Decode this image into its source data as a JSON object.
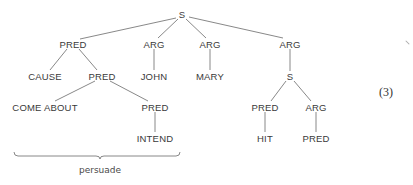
{
  "diagram": {
    "type": "syntax-tree",
    "equation_number": "(3)",
    "brace_label": "persuade",
    "nodes": [
      {
        "id": "s_root",
        "label": "S",
        "x": 182,
        "y": 14
      },
      {
        "id": "pred_1",
        "label": "PRED",
        "x": 73,
        "y": 44
      },
      {
        "id": "arg_john",
        "label": "ARG",
        "x": 154,
        "y": 44
      },
      {
        "id": "arg_mary",
        "label": "ARG",
        "x": 210,
        "y": 44
      },
      {
        "id": "arg_right",
        "label": "ARG",
        "x": 290,
        "y": 44
      },
      {
        "id": "cause",
        "label": "CAUSE",
        "x": 45,
        "y": 76
      },
      {
        "id": "pred_2",
        "label": "PRED",
        "x": 102,
        "y": 76
      },
      {
        "id": "john",
        "label": "JOHN",
        "x": 154,
        "y": 76
      },
      {
        "id": "mary",
        "label": "MARY",
        "x": 210,
        "y": 76
      },
      {
        "id": "s_inner",
        "label": "S",
        "x": 290,
        "y": 76
      },
      {
        "id": "come_about",
        "label": "COME ABOUT",
        "x": 45,
        "y": 107
      },
      {
        "id": "pred_3",
        "label": "PRED",
        "x": 155,
        "y": 107
      },
      {
        "id": "pred_hit",
        "label": "PRED",
        "x": 265,
        "y": 107
      },
      {
        "id": "arg_inner",
        "label": "ARG",
        "x": 316,
        "y": 107
      },
      {
        "id": "intend",
        "label": "INTEND",
        "x": 155,
        "y": 138
      },
      {
        "id": "hit",
        "label": "HIT",
        "x": 265,
        "y": 138
      },
      {
        "id": "pred_leaf",
        "label": "PRED",
        "x": 316,
        "y": 138
      }
    ],
    "edges": [
      [
        "s_root",
        "pred_1"
      ],
      [
        "s_root",
        "arg_john"
      ],
      [
        "s_root",
        "arg_mary"
      ],
      [
        "s_root",
        "arg_right"
      ],
      [
        "pred_1",
        "cause"
      ],
      [
        "pred_1",
        "pred_2"
      ],
      [
        "arg_john",
        "john"
      ],
      [
        "arg_mary",
        "mary"
      ],
      [
        "arg_right",
        "s_inner"
      ],
      [
        "pred_2",
        "come_about"
      ],
      [
        "pred_2",
        "pred_3"
      ],
      [
        "s_inner",
        "pred_hit"
      ],
      [
        "s_inner",
        "arg_inner"
      ],
      [
        "pred_3",
        "intend"
      ],
      [
        "pred_hit",
        "hit"
      ],
      [
        "arg_inner",
        "pred_leaf"
      ]
    ],
    "line_color": "#6a6a6a"
  }
}
